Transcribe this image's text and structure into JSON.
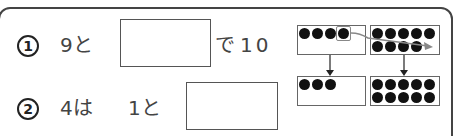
{
  "problems": [
    {
      "number": "1",
      "parts": [
        "9と",
        "で",
        "10"
      ],
      "answer_value": ""
    },
    {
      "number": "2",
      "parts": [
        "4は",
        "1と"
      ],
      "answer_value": ""
    }
  ],
  "diagram": {
    "top_left_frame_dots": 4,
    "top_right_frame_dots": 9,
    "bottom_left_frame_dots": 3,
    "bottom_right_frame_dots": 10,
    "highlighted_dot": "4th dot in top-left frame moved into top-right frame",
    "colors": {
      "dot": "#111111",
      "frame_border": "#666666",
      "move_arrow": "#888888"
    }
  }
}
